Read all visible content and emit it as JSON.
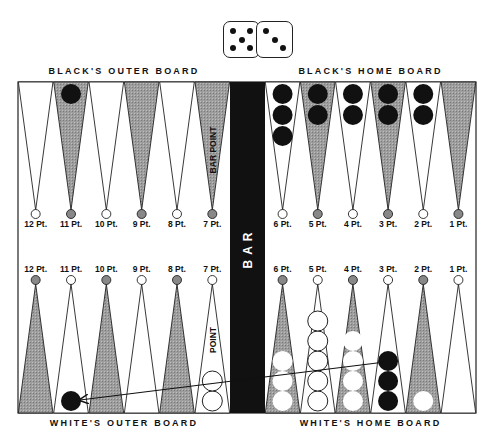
{
  "dice": {
    "left": {
      "value": 5
    },
    "right": {
      "value": 3
    }
  },
  "labels": {
    "black_outer": "BLACK'S OUTER BOARD",
    "black_home": "BLACK'S HOME BOARD",
    "white_outer": "WHITE'S OUTER BOARD",
    "white_home": "WHITE'S HOME BOARD",
    "bar": "BAR",
    "bar_point": "BAR POINT",
    "point": "POINT"
  },
  "colors": {
    "dark_point": "#9a9a9a",
    "light_point": "#ffffff",
    "bar": "#111111",
    "black_checker": "#111111",
    "white_checker": "#ffffff"
  },
  "top_points": [
    {
      "label": "12 Pt.",
      "shade": "light",
      "black": 0,
      "white": 0
    },
    {
      "label": "11 Pt.",
      "shade": "dark",
      "black": 1,
      "white": 0
    },
    {
      "label": "10 Pt.",
      "shade": "light",
      "black": 0,
      "white": 0
    },
    {
      "label": "9 Pt.",
      "shade": "dark",
      "black": 0,
      "white": 0
    },
    {
      "label": "8 Pt.",
      "shade": "light",
      "black": 0,
      "white": 0
    },
    {
      "label": "7 Pt.",
      "shade": "dark",
      "black": 0,
      "white": 0,
      "annotation": "BAR POINT"
    },
    {
      "label": "6 Pt.",
      "shade": "light",
      "black": 3,
      "white": 0
    },
    {
      "label": "5 Pt.",
      "shade": "dark",
      "black": 2,
      "white": 0
    },
    {
      "label": "4 Pt.",
      "shade": "light",
      "black": 2,
      "white": 0
    },
    {
      "label": "3 Pt.",
      "shade": "dark",
      "black": 2,
      "white": 0
    },
    {
      "label": "2 Pt.",
      "shade": "light",
      "black": 2,
      "white": 0
    },
    {
      "label": "1 Pt.",
      "shade": "dark",
      "black": 0,
      "white": 0
    }
  ],
  "bottom_points": [
    {
      "label": "12 Pt.",
      "shade": "dark",
      "black": 0,
      "white": 0
    },
    {
      "label": "11 Pt.",
      "shade": "light",
      "black": 1,
      "white": 0
    },
    {
      "label": "10 Pt.",
      "shade": "dark",
      "black": 0,
      "white": 0
    },
    {
      "label": "9 Pt.",
      "shade": "light",
      "black": 0,
      "white": 0
    },
    {
      "label": "8 Pt.",
      "shade": "dark",
      "black": 0,
      "white": 0
    },
    {
      "label": "7 Pt.",
      "shade": "light",
      "black": 0,
      "white": 2,
      "annotation": "POINT"
    },
    {
      "label": "6 Pt.",
      "shade": "dark",
      "black": 0,
      "white": 3
    },
    {
      "label": "5 Pt.",
      "shade": "light",
      "black": 0,
      "white": 5
    },
    {
      "label": "4 Pt.",
      "shade": "dark",
      "black": 0,
      "white": 4
    },
    {
      "label": "3 Pt.",
      "shade": "light",
      "black": 3,
      "white": 0
    },
    {
      "label": "2 Pt.",
      "shade": "dark",
      "black": 0,
      "white": 1
    },
    {
      "label": "1 Pt.",
      "shade": "light",
      "black": 0,
      "white": 0
    }
  ],
  "move_arrow": {
    "from": "White's 3 Pt. (black checker)",
    "to": "White's 11 Pt. (black checker)"
  }
}
